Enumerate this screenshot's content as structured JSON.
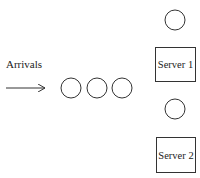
{
  "diagram": {
    "type": "queueing-system",
    "arrivals": {
      "label": "Arrivals",
      "label_pos": [
        6,
        68
      ],
      "arrow": {
        "x1": 6,
        "y1": 88,
        "x2": 45,
        "y2": 88
      }
    },
    "queue": {
      "customers": [
        {
          "cx": 71,
          "cy": 88,
          "r": 10
        },
        {
          "cx": 97,
          "cy": 88,
          "r": 10
        },
        {
          "cx": 122,
          "cy": 88,
          "r": 10
        }
      ]
    },
    "servers": [
      {
        "label": "Server 1",
        "box": {
          "x": 155,
          "y": 47,
          "w": 40,
          "h": 34
        },
        "customer": {
          "cx": 175,
          "cy": 20,
          "r": 10
        }
      },
      {
        "label": "Server 2",
        "box": {
          "x": 156,
          "y": 137,
          "w": 39,
          "h": 35
        },
        "customer": {
          "cx": 175,
          "cy": 109,
          "r": 10
        }
      }
    ],
    "colors": {
      "stroke": "#333333",
      "text": "#222222",
      "background": "#ffffff"
    }
  }
}
